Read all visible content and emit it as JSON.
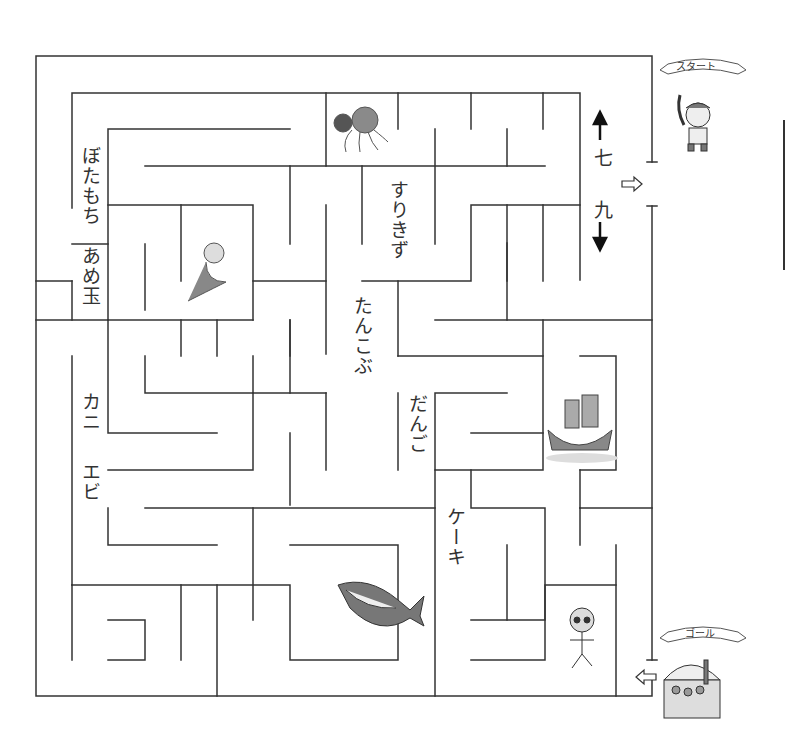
{
  "puzzle": {
    "type": "maze",
    "start_label": "スタート",
    "goal_label": "ゴール",
    "start_character": "pirate-boy",
    "goal_item": "treasure-chest",
    "direction_hints": {
      "up_label": "七",
      "down_label": "九"
    },
    "word_labels": [
      {
        "id": "botamochi",
        "text": "ぼたもち"
      },
      {
        "id": "amedama",
        "text": "あめ玉"
      },
      {
        "id": "surikizu",
        "text": "すりきず"
      },
      {
        "id": "tankobu",
        "text": "たんこぶ"
      },
      {
        "id": "dango",
        "text": "だんご"
      },
      {
        "id": "kani",
        "text": "カニ"
      },
      {
        "id": "ebi",
        "text": "エビ"
      },
      {
        "id": "keeki",
        "text": "ケーキ"
      }
    ],
    "illustrations": [
      "octopus",
      "mermaid",
      "pirate-ship",
      "shark",
      "skeleton"
    ],
    "colors": {
      "wall": "#333333",
      "background": "#ffffff",
      "picture_gray": "#8a8a8a"
    }
  }
}
